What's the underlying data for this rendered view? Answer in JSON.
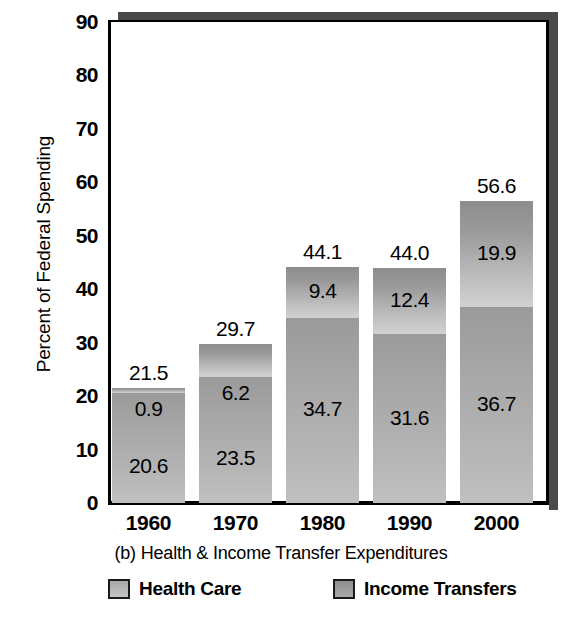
{
  "chart_data": {
    "type": "bar",
    "subtype": "stacked-bar",
    "title": "",
    "caption": "(b) Health & Income Transfer Expenditures",
    "xlabel": "",
    "ylabel": "Percent of Federal Spending",
    "categories": [
      "1960",
      "1970",
      "1980",
      "1990",
      "2000"
    ],
    "ylim": [
      0,
      90
    ],
    "yticks": [
      0,
      10,
      20,
      30,
      40,
      50,
      60,
      70,
      80,
      90
    ],
    "ytick_labels": [
      "0",
      "10",
      "20",
      "30",
      "40",
      "50",
      "60",
      "70",
      "80",
      "90"
    ],
    "grid": false,
    "legend_position": "bottom",
    "series": [
      {
        "name": "Income Transfers",
        "values": [
          20.6,
          23.5,
          34.7,
          31.6,
          36.7
        ],
        "labels": [
          "20.6",
          "23.5",
          "34.7",
          "31.6",
          "36.7"
        ],
        "color": "#a8a8a8",
        "stack_position": "bottom"
      },
      {
        "name": "Health Care",
        "values": [
          0.9,
          6.2,
          9.4,
          12.4,
          19.9
        ],
        "labels": [
          "0.9",
          "6.2",
          "9.4",
          "12.4",
          "19.9"
        ],
        "color": "#b8b8b8",
        "stack_position": "top"
      }
    ],
    "totals": [
      21.5,
      29.7,
      44.1,
      44.0,
      56.6
    ],
    "total_labels": [
      "21.5",
      "29.7",
      "44.1",
      "44.0",
      "56.6"
    ]
  },
  "legend": {
    "items": [
      {
        "label": "Health Care",
        "swatch": "health-swatch"
      },
      {
        "label": "Income Transfers",
        "swatch": "income-swatch"
      }
    ]
  },
  "colors": {
    "frame": "#000000",
    "shadow": "#4a4a4a",
    "health_care": "#b8b8b8",
    "income_transfers": "#a8a8a8",
    "background": "#ffffff",
    "text": "#000000"
  }
}
